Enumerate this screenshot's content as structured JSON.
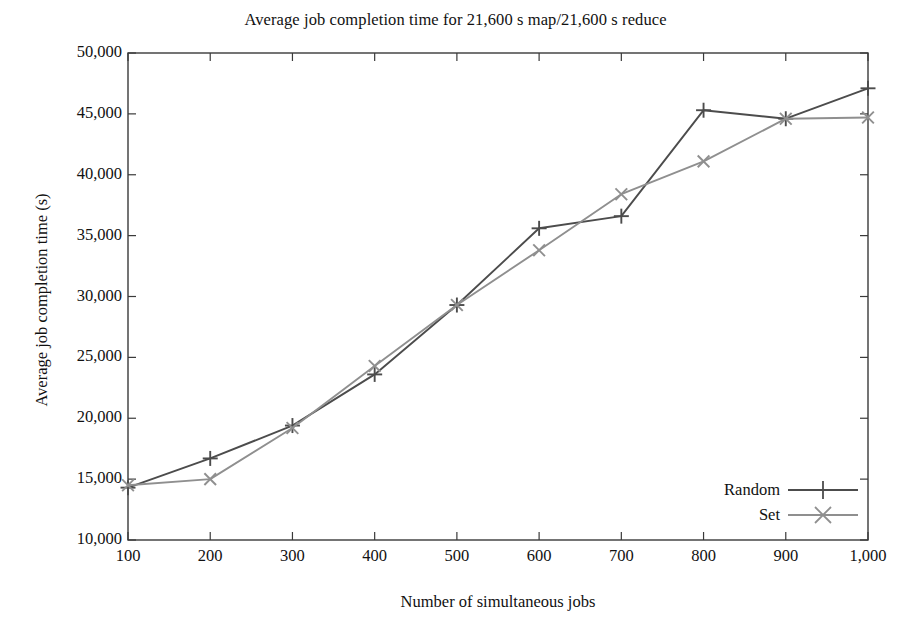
{
  "chart_data": {
    "type": "line",
    "title": "Average job completion time for 21,600 s map/21,600 s reduce",
    "xlabel": "Number of simultaneous jobs",
    "ylabel": "Average job completion time (s)",
    "x": [
      100,
      200,
      300,
      400,
      500,
      600,
      700,
      800,
      900,
      1000
    ],
    "xtick_labels": [
      "100",
      "200",
      "300",
      "400",
      "500",
      "600",
      "700",
      "800",
      "900",
      "1,000"
    ],
    "ytick_labels": [
      "10,000",
      "15,000",
      "20,000",
      "25,000",
      "30,000",
      "35,000",
      "40,000",
      "45,000",
      "50,000"
    ],
    "ytick_values": [
      10000,
      15000,
      20000,
      25000,
      30000,
      35000,
      40000,
      45000,
      50000
    ],
    "xlim": [
      100,
      1000
    ],
    "ylim": [
      10000,
      50000
    ],
    "grid": false,
    "legend_position": "bottom-right",
    "series": [
      {
        "name": "Random",
        "marker": "plus",
        "color": "#4c4c4c",
        "values": [
          14300,
          16700,
          19400,
          23600,
          29300,
          35600,
          36600,
          45300,
          44600,
          47100
        ]
      },
      {
        "name": "Set",
        "marker": "cross",
        "color": "#8f8f8f",
        "values": [
          14500,
          15000,
          19200,
          24300,
          29300,
          33800,
          38400,
          41100,
          44600,
          44700
        ]
      }
    ]
  }
}
